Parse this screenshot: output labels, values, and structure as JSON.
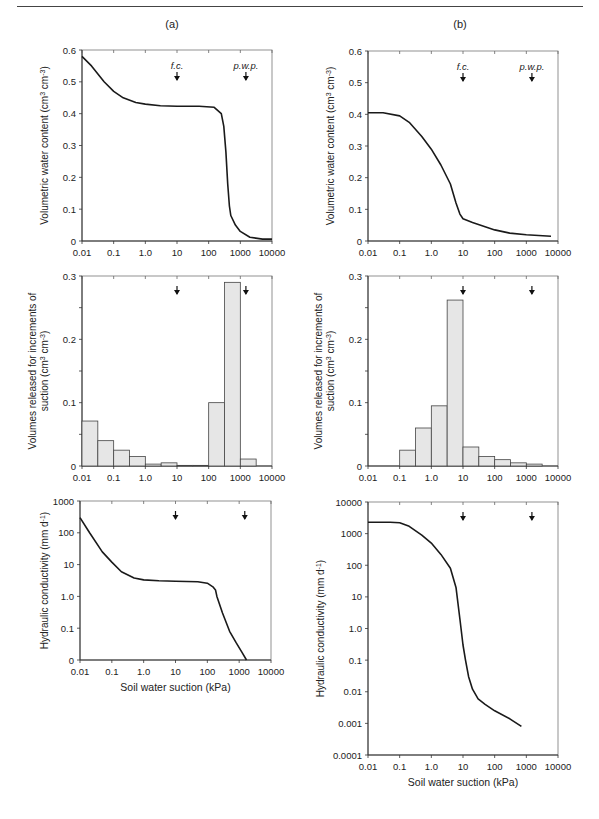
{
  "figure": {
    "panel_labels": [
      "(a)",
      "(b)"
    ],
    "marker_labels": {
      "fc": "f.c.",
      "pwp": "p.w.p."
    },
    "marker_positions_kPa": {
      "fc": 10,
      "pwp": 1500
    },
    "x_axis": {
      "label": "Soil water suction (kPa)",
      "ticks": [
        "0.01",
        "0.1",
        "1.0",
        "10",
        "100",
        "1000",
        "10000"
      ]
    },
    "line_color": "#1a1a1a",
    "bar_fill": "#e6e6e6",
    "bar_stroke": "#444444"
  },
  "chart_data": [
    {
      "id": "a-retention",
      "panel": "(a)",
      "type": "line",
      "title": "",
      "xlabel": "",
      "ylabel": "Volumetric water content (cm3 cm-3)",
      "xscale": "log",
      "xlim": [
        0.01,
        10000
      ],
      "ylim": [
        0,
        0.6
      ],
      "yticks": [
        "0",
        "0.1",
        "0.2",
        "0.3",
        "0.4",
        "0.5",
        "0.6"
      ],
      "show_markers": true,
      "show_marker_labels": true,
      "x": [
        0.01,
        0.02,
        0.05,
        0.1,
        0.2,
        0.5,
        1,
        3,
        10,
        50,
        150,
        250,
        300,
        350,
        400,
        450,
        500,
        700,
        1000,
        2000,
        5000,
        10000
      ],
      "values": [
        0.58,
        0.55,
        0.5,
        0.47,
        0.45,
        0.435,
        0.43,
        0.425,
        0.423,
        0.423,
        0.42,
        0.4,
        0.36,
        0.28,
        0.18,
        0.11,
        0.08,
        0.05,
        0.03,
        0.012,
        0.006,
        0.006
      ]
    },
    {
      "id": "b-retention",
      "panel": "(b)",
      "type": "line",
      "title": "",
      "xlabel": "",
      "ylabel": "Volumetric water content (cm3 cm-3)",
      "xscale": "log",
      "xlim": [
        0.01,
        10000
      ],
      "ylim": [
        0,
        0.6
      ],
      "yticks": [
        "0",
        "0.1",
        "0.2",
        "0.3",
        "0.4",
        "0.5",
        "0.6"
      ],
      "show_markers": true,
      "show_marker_labels": true,
      "x": [
        0.01,
        0.03,
        0.1,
        0.2,
        0.5,
        1,
        2,
        4,
        6,
        8,
        10,
        20,
        50,
        100,
        300,
        1000,
        6000
      ],
      "values": [
        0.405,
        0.405,
        0.395,
        0.375,
        0.33,
        0.29,
        0.24,
        0.18,
        0.12,
        0.085,
        0.07,
        0.058,
        0.045,
        0.035,
        0.025,
        0.02,
        0.015
      ]
    },
    {
      "id": "a-increments",
      "panel": "(a)",
      "type": "bar",
      "title": "",
      "xlabel": "",
      "ylabel": "Volumes released for increments of suction (cm3 cm-3)",
      "xscale": "log",
      "xlim": [
        0.01,
        10000
      ],
      "ylim": [
        0,
        0.3
      ],
      "yticks": [
        "0",
        "0.1",
        "0.2",
        "0.3"
      ],
      "show_markers": true,
      "show_marker_labels": false,
      "categories": [
        "0.01-0.03",
        "0.03-0.1",
        "0.1-0.3",
        "0.3-1",
        "1-3",
        "3-10",
        "10-30",
        "30-100",
        "100-300",
        "300-1000",
        "1000-3000"
      ],
      "bins": [
        [
          0.01,
          0.0316
        ],
        [
          0.0316,
          0.1
        ],
        [
          0.1,
          0.316
        ],
        [
          0.316,
          1
        ],
        [
          1,
          3.16
        ],
        [
          3.16,
          10
        ],
        [
          10,
          31.6
        ],
        [
          31.6,
          100
        ],
        [
          100,
          316
        ],
        [
          316,
          1000
        ],
        [
          1000,
          3160
        ]
      ],
      "values": [
        0.071,
        0.04,
        0.025,
        0.015,
        0.003,
        0.005,
        0.001,
        0.001,
        0.1,
        0.29,
        0.011
      ]
    },
    {
      "id": "b-increments",
      "panel": "(b)",
      "type": "bar",
      "title": "",
      "xlabel": "",
      "ylabel": "Volumes released for increments of suction (cm3 cm-3)",
      "xscale": "log",
      "xlim": [
        0.01,
        10000
      ],
      "ylim": [
        0,
        0.3
      ],
      "yticks": [
        "0",
        "0.1",
        "0.2",
        "0.3"
      ],
      "show_markers": true,
      "show_marker_labels": false,
      "categories": [
        "0.1-0.3",
        "0.3-1",
        "1-3",
        "3-10",
        "10-30",
        "30-100",
        "100-300",
        "300-1000",
        "1000-3000"
      ],
      "bins": [
        [
          0.1,
          0.316
        ],
        [
          0.316,
          1
        ],
        [
          1,
          3.16
        ],
        [
          3.16,
          10
        ],
        [
          10,
          31.6
        ],
        [
          31.6,
          100
        ],
        [
          100,
          316
        ],
        [
          316,
          1000
        ],
        [
          1000,
          3160
        ]
      ],
      "values": [
        0.025,
        0.06,
        0.095,
        0.262,
        0.03,
        0.015,
        0.01,
        0.005,
        0.003
      ]
    },
    {
      "id": "a-conductivity",
      "panel": "(a)",
      "type": "line",
      "title": "",
      "xlabel": "Soil water suction (kPa)",
      "ylabel": "Hydraulic conductivity (mm d-1)",
      "xscale": "log",
      "xlim": [
        0.01,
        10000
      ],
      "yscale": "log",
      "ylim_decades": [
        -2,
        3
      ],
      "yticks": [
        "0",
        "0.1",
        "1.0",
        "10",
        "100",
        "1000"
      ],
      "show_markers": true,
      "show_marker_labels": false,
      "x": [
        0.01,
        0.02,
        0.05,
        0.1,
        0.2,
        0.5,
        1,
        3,
        10,
        50,
        100,
        150,
        180,
        200,
        300,
        500,
        800,
        1200,
        1700
      ],
      "values": [
        300,
        100,
        25,
        12,
        6,
        3.8,
        3.3,
        3.1,
        3.0,
        2.9,
        2.6,
        2.0,
        1.6,
        1.0,
        0.3,
        0.08,
        0.035,
        0.018,
        0.01
      ]
    },
    {
      "id": "b-conductivity",
      "panel": "(b)",
      "type": "line",
      "title": "",
      "xlabel": "Soil water suction (kPa)",
      "ylabel": "Hydraulic conductivity (mm d-1)",
      "xscale": "log",
      "xlim": [
        0.01,
        10000
      ],
      "yscale": "log",
      "ylim_decades": [
        -4,
        4
      ],
      "yticks": [
        "0.0001",
        "0.001",
        "0.01",
        "0.1",
        "1.0",
        "10",
        "100",
        "1000",
        "10000"
      ],
      "show_markers": true,
      "show_marker_labels": false,
      "x": [
        0.01,
        0.05,
        0.1,
        0.2,
        0.5,
        1,
        2,
        4,
        6,
        8,
        10,
        12,
        15,
        20,
        30,
        50,
        100,
        300,
        700
      ],
      "values": [
        2300,
        2300,
        2200,
        1700,
        900,
        500,
        220,
        80,
        20,
        2,
        0.3,
        0.1,
        0.03,
        0.012,
        0.006,
        0.004,
        0.0025,
        0.0014,
        0.0008
      ]
    }
  ]
}
